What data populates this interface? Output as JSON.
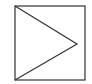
{
  "diagram": {
    "shapes": [
      {
        "type": "square",
        "x": 15,
        "y": 6,
        "width": 70,
        "height": 74,
        "stroke": "#333333"
      },
      {
        "type": "triangle",
        "points": [
          [
            15,
            6
          ],
          [
            77,
            44
          ],
          [
            15,
            80
          ]
        ],
        "stroke": "#333333"
      }
    ],
    "icon": "play-icon"
  }
}
